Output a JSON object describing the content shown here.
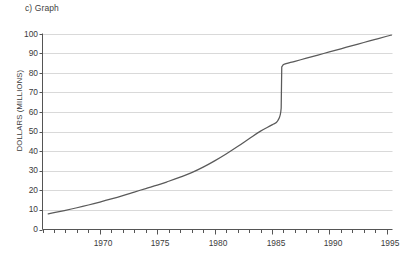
{
  "figure": {
    "title": "c) Graph"
  },
  "chart_data": {
    "type": "line",
    "title": "c) Graph",
    "xlabel": "",
    "ylabel": "DOLLARS (MILLIONS)",
    "xlim": [
      1965,
      1995.5
    ],
    "ylim": [
      0,
      100
    ],
    "grid": true,
    "legend": null,
    "y_ticks": [
      0,
      10,
      20,
      30,
      40,
      50,
      60,
      70,
      80,
      90,
      100
    ],
    "y_tick_labels": [
      "0",
      "10",
      "20",
      "30",
      "40",
      "50",
      "60",
      "70",
      "80",
      "90",
      "100"
    ],
    "x_ticks_major": [
      1970,
      1975,
      1980,
      1985,
      1990,
      1995
    ],
    "x_tick_labels": [
      "1970",
      "1975",
      "1980",
      "1985",
      "1990",
      "1995"
    ],
    "x_ticks_minor_step": 1,
    "line_color": "#5a5a5a",
    "grid_color": "#d9d9d9",
    "axis_color": "#555555",
    "series": [
      {
        "name": "Dollars (millions)",
        "x": [
          1965.5,
          1966,
          1967,
          1968,
          1969,
          1970,
          1971,
          1972,
          1973,
          1974,
          1975,
          1976,
          1977,
          1978,
          1979,
          1980,
          1981,
          1982,
          1983,
          1984,
          1985,
          1985.5,
          1985.8,
          1985.85,
          1986,
          1987,
          1988,
          1989,
          1990,
          1991,
          1992,
          1993,
          1994,
          1995,
          1995.4
        ],
        "values": [
          8,
          8.6,
          9.8,
          11.1,
          12.5,
          14.0,
          15.6,
          17.3,
          19.1,
          20.9,
          22.6,
          24.6,
          26.7,
          29.0,
          31.8,
          35.0,
          38.5,
          42.3,
          46.3,
          50.2,
          53.4,
          55.5,
          62.0,
          83.0,
          84.2,
          85.8,
          87.4,
          89.0,
          90.6,
          92.2,
          93.8,
          95.4,
          97.0,
          98.6,
          99.2
        ]
      }
    ],
    "annotations": [
      {
        "text": "sharp vertical rise near 1985.8 from about 62 to about 83"
      }
    ]
  }
}
